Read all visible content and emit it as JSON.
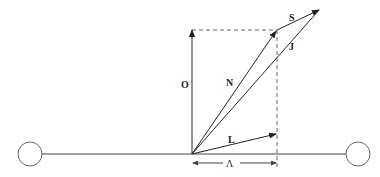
{
  "diagram": {
    "labels": {
      "O": "O",
      "N": "N",
      "S": "S",
      "J": "J",
      "L": "L",
      "Lambda": "Λ"
    },
    "vectors": [
      {
        "name": "O",
        "from": [
          192,
          154
        ],
        "to": [
          192,
          29
        ]
      },
      {
        "name": "N",
        "from": [
          192,
          154
        ],
        "to": [
          277,
          30
        ]
      },
      {
        "name": "S",
        "from": [
          277,
          30
        ],
        "to": [
          320,
          9
        ]
      },
      {
        "name": "J",
        "from": [
          192,
          154
        ],
        "to": [
          320,
          9
        ]
      },
      {
        "name": "L",
        "from": [
          192,
          154
        ],
        "to": [
          277,
          134
        ]
      }
    ],
    "circles": [
      {
        "name": "left-node",
        "cx": 30,
        "cy": 154,
        "r": 12
      },
      {
        "name": "right-node",
        "cx": 358,
        "cy": 154,
        "r": 12
      }
    ]
  }
}
